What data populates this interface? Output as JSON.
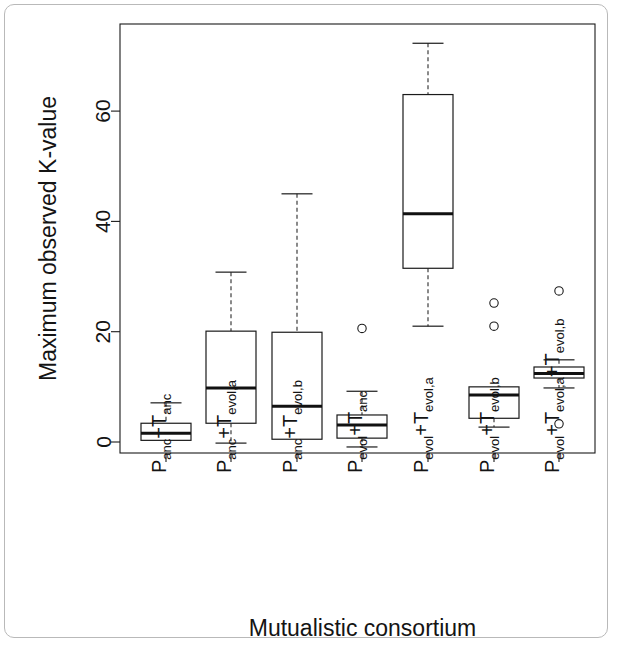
{
  "figure": {
    "kind": "boxplot-figure",
    "background_color": "#ffffff",
    "frame_color": "#b9b9b9",
    "line_color": "#1a1a1a"
  },
  "chart_data": {
    "type": "box",
    "title": "",
    "xlabel": "Mutualistic consortium",
    "ylabel": "Maximum observed K-value",
    "ylim": [
      -4,
      76
    ],
    "yticks": [
      0,
      20,
      40,
      60
    ],
    "ytick_labels": [
      "0",
      "20",
      "40",
      "60"
    ],
    "grid": false,
    "legend": "none",
    "categories": [
      "P_anc+T_anc",
      "P_anc+T_evol,a",
      "P_anc+T_evol,b",
      "P_evol+T_anc",
      "P_evol+T_evol,a",
      "P_evol+T_evol,b",
      "P_evol+T_evol,a+T_evol,b"
    ],
    "category_labels": [
      {
        "parts": [
          {
            "t": "P",
            "sub": false
          },
          {
            "t": "anc",
            "sub": true
          },
          {
            "t": "+T",
            "sub": false
          },
          {
            "t": "anc",
            "sub": true
          }
        ]
      },
      {
        "parts": [
          {
            "t": "P",
            "sub": false
          },
          {
            "t": "anc",
            "sub": true
          },
          {
            "t": "+T",
            "sub": false
          },
          {
            "t": "evol,a",
            "sub": true
          }
        ]
      },
      {
        "parts": [
          {
            "t": "P",
            "sub": false
          },
          {
            "t": "anc",
            "sub": true
          },
          {
            "t": "+T",
            "sub": false
          },
          {
            "t": "evol,b",
            "sub": true
          }
        ]
      },
      {
        "parts": [
          {
            "t": "P",
            "sub": false
          },
          {
            "t": "evol",
            "sub": true
          },
          {
            "t": "+T",
            "sub": false
          },
          {
            "t": "anc",
            "sub": true
          }
        ]
      },
      {
        "parts": [
          {
            "t": "P",
            "sub": false
          },
          {
            "t": "evol",
            "sub": true
          },
          {
            "t": "+T",
            "sub": false
          },
          {
            "t": "evol,a",
            "sub": true
          }
        ]
      },
      {
        "parts": [
          {
            "t": "P",
            "sub": false
          },
          {
            "t": "evol",
            "sub": true
          },
          {
            "t": "+T",
            "sub": false
          },
          {
            "t": "evol,b",
            "sub": true
          }
        ]
      },
      {
        "parts": [
          {
            "t": "P",
            "sub": false
          },
          {
            "t": "evol",
            "sub": true
          },
          {
            "t": "+T",
            "sub": false
          },
          {
            "t": "evol,a",
            "sub": true
          },
          {
            "t": "+T",
            "sub": false
          },
          {
            "t": "evol,b",
            "sub": true
          }
        ]
      }
    ],
    "boxes": [
      {
        "name": "P_anc+T_anc",
        "whisker_low": 0.0,
        "q1": 0.3,
        "median": 1.6,
        "q3": 3.4,
        "whisker_high": 7.1,
        "outliers": [],
        "has_low_cap": false
      },
      {
        "name": "P_anc+T_evol,a",
        "whisker_low": -0.2,
        "q1": 3.4,
        "median": 9.8,
        "q3": 20.1,
        "whisker_high": 30.8,
        "outliers": [],
        "has_low_cap": true
      },
      {
        "name": "P_anc+T_evol,b",
        "whisker_low": 0.5,
        "q1": 0.5,
        "median": 6.5,
        "q3": 19.9,
        "whisker_high": 45.0,
        "outliers": [],
        "has_low_cap": false
      },
      {
        "name": "P_evol+T_anc",
        "whisker_low": -0.9,
        "q1": 0.7,
        "median": 3.1,
        "q3": 4.9,
        "whisker_high": 9.2,
        "outliers": [
          20.6
        ],
        "has_low_cap": true
      },
      {
        "name": "P_evol+T_evol,a",
        "whisker_low": 21.0,
        "q1": 31.5,
        "median": 41.4,
        "q3": 63.0,
        "whisker_high": 72.3,
        "outliers": [],
        "has_low_cap": true
      },
      {
        "name": "P_evol+T_evol,b",
        "whisker_low": 2.7,
        "q1": 4.3,
        "median": 8.5,
        "q3": 10.0,
        "whisker_high": 10.0,
        "outliers": [
          25.2,
          21.0
        ],
        "has_low_cap": true
      },
      {
        "name": "P_evol+T_evol,a+T_evol,b",
        "whisker_low": 9.8,
        "q1": 11.6,
        "median": 12.4,
        "q3": 13.6,
        "whisker_high": 14.9,
        "outliers": [
          27.4,
          3.3
        ],
        "has_low_cap": true
      }
    ]
  },
  "geometry": {
    "plot_left": 120,
    "plot_right": 595,
    "plot_top": 24,
    "plot_bottom": 453,
    "y_zero_px": 442,
    "px_per_unit": 5.515,
    "box_centers": [
      166,
      231,
      297,
      362,
      428,
      494,
      559
    ],
    "box_half_width": 25
  }
}
